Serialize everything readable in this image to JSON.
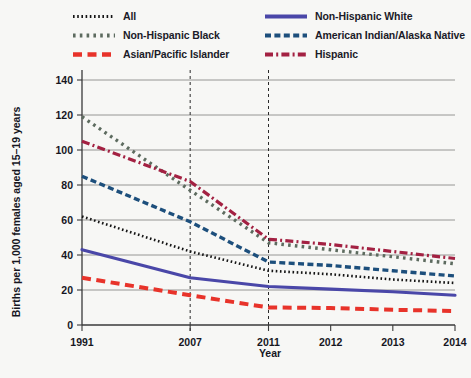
{
  "chart_data": {
    "type": "line",
    "title": "",
    "xlabel": "Year",
    "ylabel": "Births per 1,000 females aged 15–19 years",
    "x": [
      "1991",
      "2007",
      "2011",
      "2012",
      "2013",
      "2014"
    ],
    "xtick_labels": [
      "1991",
      "2007",
      "2011",
      "2012",
      "2013",
      "2014"
    ],
    "ytick_labels": [
      "0",
      "20",
      "40",
      "60",
      "80",
      "100",
      "120",
      "140"
    ],
    "ylim": [
      0,
      140
    ],
    "ytick_step": 20,
    "grid": "horizontal",
    "legend_position": "top",
    "reference_lines": [
      "2007",
      "2011"
    ],
    "series": [
      {
        "name": "All",
        "color": "#141414",
        "style": "dotted",
        "values": [
          62,
          42,
          31,
          29,
          26,
          24
        ]
      },
      {
        "name": "Non-Hispanic Black",
        "color": "#5d6b5f",
        "style": "dotted-large",
        "values": [
          119,
          77,
          47,
          43,
          39,
          35
        ]
      },
      {
        "name": "Asian/Pacific Islander",
        "color": "#e8332a",
        "style": "dashed-large",
        "values": [
          27,
          17,
          10,
          9.7,
          8.7,
          8
        ]
      },
      {
        "name": "Non-Hispanic White",
        "color": "#4a47a8",
        "style": "solid",
        "values": [
          43,
          27,
          22,
          20.5,
          19,
          17
        ]
      },
      {
        "name": "American Indian/Alaska Native",
        "color": "#1d4f7c",
        "style": "dashed",
        "values": [
          85,
          59,
          36,
          34,
          31,
          28
        ]
      },
      {
        "name": "Hispanic",
        "color": "#a32142",
        "style": "dash-dot",
        "values": [
          105,
          82,
          49,
          46,
          42,
          38
        ]
      }
    ]
  },
  "legend": {
    "columns": [
      [
        {
          "label": "All",
          "key": "All"
        },
        {
          "label": "Non-Hispanic Black",
          "key": "Non-Hispanic Black"
        },
        {
          "label": "Asian/Pacific Islander",
          "key": "Asian/Pacific Islander"
        }
      ],
      [
        {
          "label": "Non-Hispanic White",
          "key": "Non-Hispanic White"
        },
        {
          "label": "American Indian/Alaska Native",
          "key": "American Indian/Alaska Native"
        },
        {
          "label": "Hispanic",
          "key": "Hispanic"
        }
      ]
    ]
  },
  "axes": {
    "y_title": "Births per 1,000 females aged 15–19 years",
    "x_title": "Year"
  },
  "colors": {
    "all": "#141414",
    "non_hispanic_black": "#5d6b5f",
    "asian_pacific_islander": "#e8332a",
    "non_hispanic_white": "#4a47a8",
    "american_indian_alaska_native": "#1d4f7c",
    "hispanic": "#a32142",
    "grid": "#8a8a8a",
    "axis": "#3a3a3a",
    "background": "#f7f7f5"
  }
}
